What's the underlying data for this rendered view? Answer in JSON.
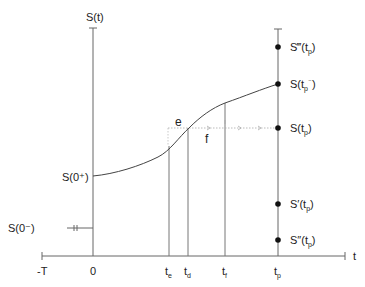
{
  "axes": {
    "y_label": "S(t)",
    "x_label": "t",
    "x_ticks": [
      {
        "label": "-T",
        "sub": "",
        "x": 42
      },
      {
        "label": "0",
        "sub": "",
        "x": 93
      },
      {
        "label": "t",
        "sub": "e",
        "x": 169
      },
      {
        "label": "t",
        "sub": "d",
        "x": 188
      },
      {
        "label": "t",
        "sub": "f",
        "x": 225
      },
      {
        "label": "t",
        "sub": "p",
        "x": 278
      }
    ]
  },
  "left_labels": {
    "s0_plus": "S(0⁺)",
    "s0_minus": "S(0⁻)"
  },
  "curve_points": {
    "e": "e",
    "f": "f"
  },
  "right_labels": [
    {
      "id": "s-triple-prime",
      "main": "S‴(t",
      "sub": "p",
      "tail": ")",
      "y": 47
    },
    {
      "id": "s-tp-minus",
      "main": "S(t",
      "sub": "p",
      "sup": "⁻",
      "tail": ")",
      "y": 84
    },
    {
      "id": "s-tp",
      "main": "S(t",
      "sub": "p",
      "tail": ")",
      "y": 128
    },
    {
      "id": "s-prime",
      "main": "S′(t",
      "sub": "p",
      "tail": ")",
      "y": 204
    },
    {
      "id": "s-double-prime",
      "main": "S″(t",
      "sub": "p",
      "tail": ")",
      "y": 240
    }
  ],
  "colors": {
    "line": "#555555",
    "dot": "#111111",
    "dotted": "#aaaaaa"
  }
}
